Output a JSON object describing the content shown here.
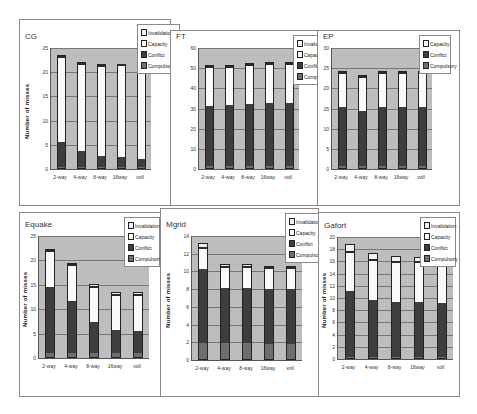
{
  "legend_labels": {
    "invalidation": "Invalidation",
    "capacity": "Capacity",
    "conflict": "Conflict",
    "compulsory": "Compulsory"
  },
  "colors": {
    "compulsory": "#6e6e6e",
    "conflict": "#3e3e3e",
    "capacity": "#fafafa",
    "invalidation": "#f0f0f0",
    "plot_bg": "#bdbdbd"
  },
  "chart_data": [
    {
      "type": "bar",
      "stacked": true,
      "title": "CG",
      "ylabel": "Number of misses",
      "xlabel": "",
      "categories": [
        "2-way",
        "4-way",
        "8-way",
        "16way",
        "voll"
      ],
      "ylim": [
        0,
        25
      ],
      "yticks": [
        0,
        5,
        10,
        15,
        20,
        25
      ],
      "legend": [
        "Invalidation",
        "Capacity",
        "Conflict",
        "Compulsory"
      ],
      "series": [
        {
          "name": "Compulsory",
          "values": [
            0.3,
            0.3,
            0.3,
            0.3,
            0.3
          ]
        },
        {
          "name": "Conflict",
          "values": [
            5.2,
            3.2,
            2.3,
            2.0,
            1.5
          ]
        },
        {
          "name": "Capacity",
          "values": [
            17.6,
            18.3,
            18.8,
            19.1,
            19.6
          ]
        },
        {
          "name": "Invalidation",
          "values": [
            0.4,
            0.4,
            0.4,
            0.4,
            0.4
          ]
        }
      ]
    },
    {
      "type": "bar",
      "stacked": true,
      "title": "FT",
      "ylabel": "",
      "xlabel": "",
      "categories": [
        "2-way",
        "4-way",
        "8-way",
        "16way",
        "voll"
      ],
      "ylim": [
        0,
        60
      ],
      "yticks": [
        0,
        10,
        20,
        30,
        40,
        50,
        60
      ],
      "legend": [
        "Invalidation",
        "Capacity",
        "Conflict",
        "Compulsory"
      ],
      "series": [
        {
          "name": "Compulsory",
          "values": [
            1.0,
            1.0,
            1.0,
            1.0,
            1.0
          ]
        },
        {
          "name": "Conflict",
          "values": [
            30.5,
            31.0,
            31.5,
            32.0,
            32.0
          ]
        },
        {
          "name": "Capacity",
          "values": [
            19.5,
            19.0,
            19.5,
            19.5,
            19.5
          ]
        },
        {
          "name": "Invalidation",
          "values": [
            0.5,
            0.5,
            0.5,
            0.5,
            0.5
          ]
        }
      ]
    },
    {
      "type": "bar",
      "stacked": true,
      "title": "EP",
      "ylabel": "",
      "xlabel": "",
      "categories": [
        "2-way",
        "4-way",
        "8-way",
        "16way",
        "voll"
      ],
      "ylim": [
        0,
        30
      ],
      "yticks": [
        0,
        5,
        10,
        15,
        20,
        25,
        30
      ],
      "legend": [
        "Capacity",
        "Conflict",
        "Compulsory"
      ],
      "series": [
        {
          "name": "Compulsory",
          "values": [
            0.5,
            0.5,
            0.5,
            0.5,
            0.5
          ]
        },
        {
          "name": "Conflict",
          "values": [
            15.0,
            14.0,
            15.0,
            15.0,
            15.0
          ]
        },
        {
          "name": "Capacity",
          "values": [
            8.5,
            8.5,
            8.5,
            8.5,
            8.5
          ]
        },
        {
          "name": "Invalidation",
          "values": [
            0.3,
            0.3,
            0.3,
            0.3,
            0.3
          ]
        }
      ]
    },
    {
      "type": "bar",
      "stacked": true,
      "title": "Equake",
      "ylabel": "Number of misses",
      "xlabel": "",
      "categories": [
        "2-way",
        "4-way",
        "8-way",
        "16way",
        "voll"
      ],
      "ylim": [
        0,
        25
      ],
      "yticks": [
        0,
        5,
        10,
        15,
        20,
        25
      ],
      "legend": [
        "Invalidation",
        "Capacity",
        "Conflict",
        "Compulsory"
      ],
      "series": [
        {
          "name": "Compulsory",
          "values": [
            0.8,
            0.8,
            0.8,
            0.8,
            0.8
          ]
        },
        {
          "name": "Conflict",
          "values": [
            13.9,
            11.0,
            6.6,
            5.0,
            4.8
          ]
        },
        {
          "name": "Capacity",
          "values": [
            7.2,
            7.2,
            7.2,
            7.2,
            7.4
          ]
        },
        {
          "name": "Invalidation",
          "values": [
            0.4,
            0.5,
            0.5,
            0.5,
            0.5
          ]
        }
      ]
    },
    {
      "type": "bar",
      "stacked": true,
      "title": "Mgrid",
      "ylabel": "Number of misses",
      "xlabel": "",
      "categories": [
        "2-way",
        "4-way",
        "8-way",
        "16way",
        "voll"
      ],
      "ylim": [
        0,
        14
      ],
      "yticks": [
        0,
        2,
        4,
        6,
        8,
        10,
        12,
        14
      ],
      "legend": [
        "Invalidation",
        "Capacity",
        "Conflict",
        "Compulsory"
      ],
      "series": [
        {
          "name": "Compulsory",
          "values": [
            1.8,
            1.8,
            1.8,
            1.8,
            1.8
          ]
        },
        {
          "name": "Conflict",
          "values": [
            8.5,
            6.4,
            6.4,
            6.4,
            6.4
          ]
        },
        {
          "name": "Capacity",
          "values": [
            2.3,
            2.3,
            2.3,
            2.3,
            2.3
          ]
        },
        {
          "name": "Invalidation",
          "values": [
            0.6,
            0.3,
            0.3,
            0.1,
            0.1
          ]
        }
      ]
    },
    {
      "type": "bar",
      "stacked": true,
      "title": "Gafort",
      "ylabel": "Number of misses",
      "xlabel": "",
      "categories": [
        "2-way",
        "4-way",
        "8-way",
        "16way",
        "voll"
      ],
      "ylim": [
        0,
        20
      ],
      "yticks": [
        0,
        2,
        4,
        6,
        8,
        10,
        12,
        14,
        16,
        18,
        20
      ],
      "legend": [
        "Invalidation",
        "Capacity",
        "Conflict",
        "Compulsory"
      ],
      "series": [
        {
          "name": "Compulsory",
          "values": [
            0.1,
            0.1,
            0.1,
            0.1,
            0.1
          ]
        },
        {
          "name": "Conflict",
          "values": [
            11.0,
            9.6,
            9.3,
            9.2,
            9.1
          ]
        },
        {
          "name": "Capacity",
          "values": [
            6.5,
            6.5,
            6.5,
            6.6,
            6.6
          ]
        },
        {
          "name": "Invalidation",
          "values": [
            1.3,
            1.2,
            1.0,
            0.8,
            0.7
          ]
        }
      ]
    }
  ],
  "panels": [
    {
      "left": 19,
      "top": 19,
      "width": 152,
      "height": 187,
      "plot": {
        "left": 30,
        "top": 28,
        "width": 100,
        "height": 121
      },
      "legend": {
        "left": 117,
        "top": 4,
        "width": 43,
        "height": 48
      }
    },
    {
      "left": 170,
      "top": 30,
      "width": 148,
      "height": 176,
      "plot": {
        "left": 27,
        "top": 17,
        "width": 100,
        "height": 121
      },
      "legend": {
        "left": 122,
        "top": 4,
        "width": 33,
        "height": 48
      }
    },
    {
      "left": 317,
      "top": 30,
      "width": 143,
      "height": 176,
      "plot": {
        "left": 13,
        "top": 17,
        "width": 100,
        "height": 121
      },
      "legend": {
        "left": 101,
        "top": 4,
        "width": 32,
        "height": 40
      }
    },
    {
      "left": 19,
      "top": 212,
      "width": 142,
      "height": 185,
      "plot": {
        "left": 18,
        "top": 23,
        "width": 110,
        "height": 122
      },
      "legend": {
        "left": 104,
        "top": 4,
        "width": 36,
        "height": 48
      }
    },
    {
      "left": 160,
      "top": 208,
      "width": 159,
      "height": 189,
      "plot": {
        "left": 30,
        "top": 27,
        "width": 110,
        "height": 124
      },
      "legend": {
        "left": 124,
        "top": 4,
        "width": 34,
        "height": 48
      }
    },
    {
      "left": 318,
      "top": 212,
      "width": 142,
      "height": 185,
      "plot": {
        "left": 18,
        "top": 24,
        "width": 115,
        "height": 122
      },
      "legend": {
        "left": 101,
        "top": 4,
        "width": 36,
        "height": 48
      }
    }
  ]
}
